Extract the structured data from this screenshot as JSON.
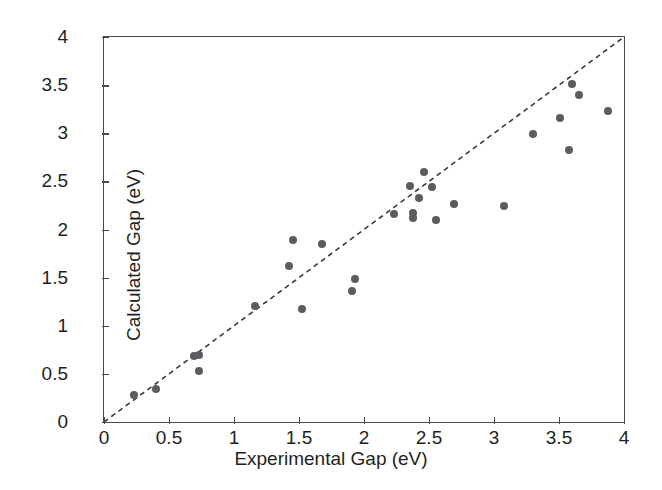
{
  "chart_data": {
    "type": "scatter",
    "title": "",
    "xlabel": "Experimental Gap (eV)",
    "ylabel": "Calculated Gap (eV)",
    "xlim": [
      0,
      4
    ],
    "ylim": [
      0,
      4
    ],
    "grid": false,
    "legend": null,
    "xticks": [
      "0",
      "0.5",
      "1",
      "1.5",
      "2",
      "2.5",
      "3",
      "3.5",
      "4"
    ],
    "xtick_values": [
      0,
      0.5,
      1,
      1.5,
      2,
      2.5,
      3,
      3.5,
      4
    ],
    "yticks": [
      "0",
      "0.5",
      "1",
      "1.5",
      "2",
      "2.5",
      "3",
      "3.5",
      "4"
    ],
    "ytick_values": [
      0,
      0.5,
      1,
      1.5,
      2,
      2.5,
      3,
      3.5,
      4
    ],
    "marker_color": "#5b5b60",
    "marker_shape": "circle",
    "axis_color": "#4a4a4a",
    "reference_line": {
      "label": "y = x parity line",
      "style": "dashed",
      "color": "#3a3a3a",
      "from": [
        0,
        0
      ],
      "to": [
        4,
        4
      ]
    },
    "x": [
      0.23,
      0.4,
      0.69,
      0.73,
      0.73,
      1.16,
      1.42,
      1.45,
      1.52,
      1.68,
      1.91,
      1.93,
      2.23,
      2.35,
      2.38,
      2.38,
      2.42,
      2.46,
      2.52,
      2.55,
      2.69,
      3.08,
      3.3,
      3.51,
      3.58,
      3.6,
      3.65,
      3.88
    ],
    "y": [
      0.28,
      0.34,
      0.69,
      0.7,
      0.53,
      1.21,
      1.62,
      1.89,
      1.17,
      1.85,
      1.36,
      1.49,
      2.16,
      2.45,
      2.17,
      2.12,
      2.33,
      2.6,
      2.44,
      2.1,
      2.27,
      2.24,
      2.99,
      3.16,
      2.83,
      3.51,
      3.4,
      3.23
    ],
    "points": [
      {
        "x": 0.23,
        "y": 0.28
      },
      {
        "x": 0.4,
        "y": 0.34
      },
      {
        "x": 0.69,
        "y": 0.69
      },
      {
        "x": 0.73,
        "y": 0.7
      },
      {
        "x": 0.73,
        "y": 0.53
      },
      {
        "x": 1.16,
        "y": 1.21
      },
      {
        "x": 1.42,
        "y": 1.62
      },
      {
        "x": 1.45,
        "y": 1.89
      },
      {
        "x": 1.52,
        "y": 1.17
      },
      {
        "x": 1.68,
        "y": 1.85
      },
      {
        "x": 1.91,
        "y": 1.36
      },
      {
        "x": 1.93,
        "y": 1.49
      },
      {
        "x": 2.23,
        "y": 2.16
      },
      {
        "x": 2.35,
        "y": 2.45
      },
      {
        "x": 2.38,
        "y": 2.17
      },
      {
        "x": 2.38,
        "y": 2.12
      },
      {
        "x": 2.42,
        "y": 2.33
      },
      {
        "x": 2.46,
        "y": 2.6
      },
      {
        "x": 2.52,
        "y": 2.44
      },
      {
        "x": 2.55,
        "y": 2.1
      },
      {
        "x": 2.69,
        "y": 2.27
      },
      {
        "x": 3.08,
        "y": 2.24
      },
      {
        "x": 3.3,
        "y": 2.99
      },
      {
        "x": 3.51,
        "y": 3.16
      },
      {
        "x": 3.58,
        "y": 2.83
      },
      {
        "x": 3.6,
        "y": 3.51
      },
      {
        "x": 3.65,
        "y": 3.4
      },
      {
        "x": 3.88,
        "y": 3.23
      }
    ]
  }
}
